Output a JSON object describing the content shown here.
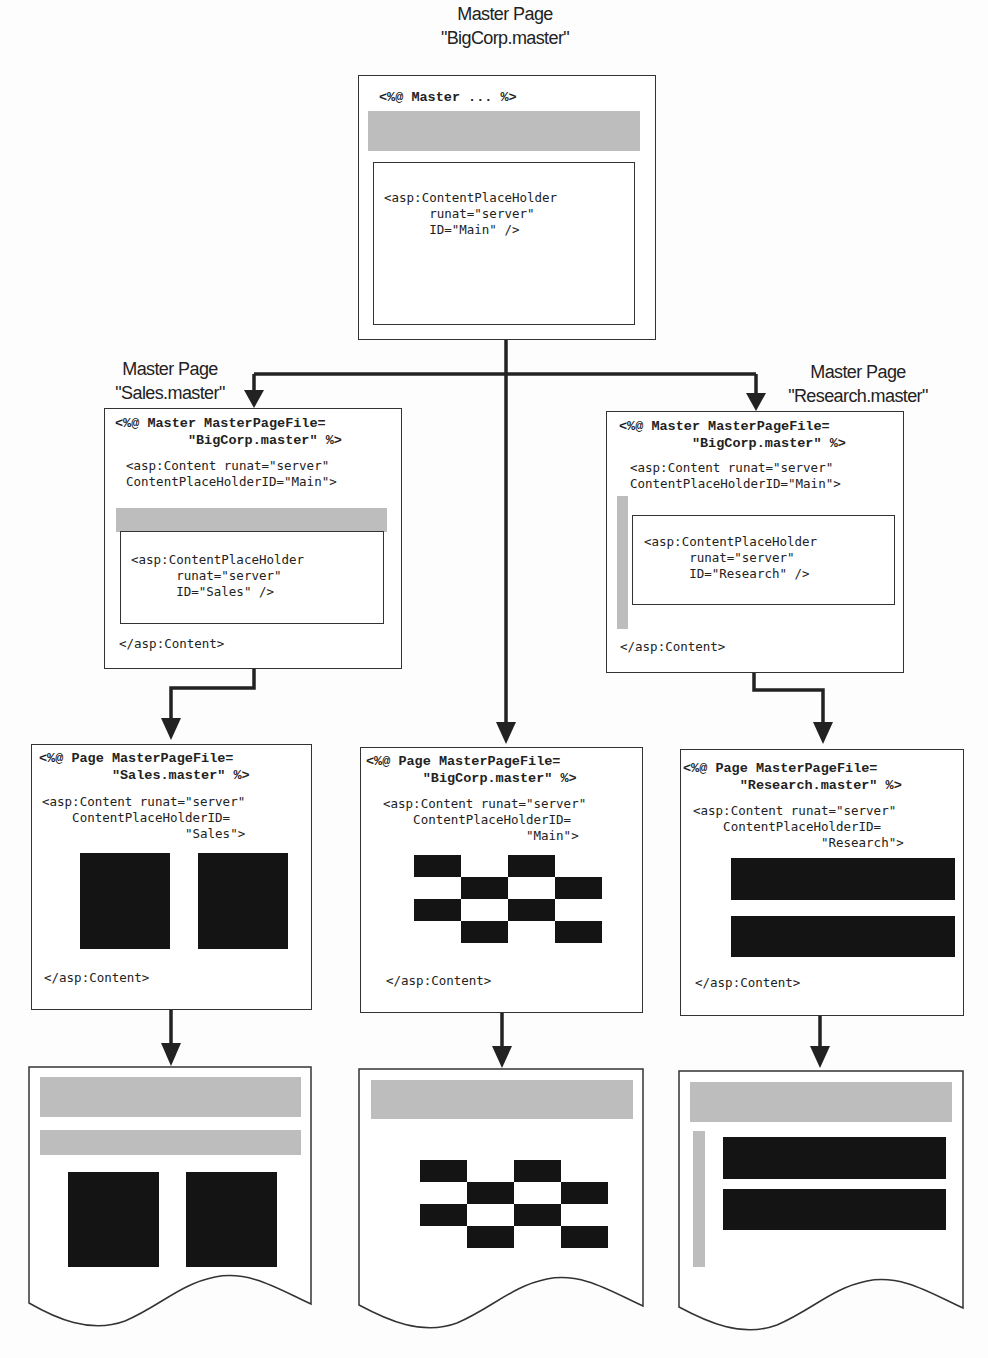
{
  "diagram": {
    "colors": {
      "line": "#222222",
      "master_region": "#bdbdbd",
      "content_block": "#141414",
      "background": "#fdfdfd"
    },
    "top_master": {
      "label_line1": "Master Page",
      "label_line2": "\"BigCorp.master\"",
      "directive": "<%@ Master ... %>",
      "placeholder_code": "<asp:ContentPlaceHolder\n      runat=\"server\"\n      ID=\"Main\" />"
    },
    "sales_master": {
      "label_line1": "Master Page",
      "label_line2": "\"Sales.master\"",
      "directive": "<%@ Master MasterPageFile=\n         \"BigCorp.master\" %>",
      "content_open": "<asp:Content runat=\"server\"\nContentPlaceHolderID=\"Main\">",
      "placeholder_code": "<asp:ContentPlaceHolder\n      runat=\"server\"\n      ID=\"Sales\" />",
      "content_close": "</asp:Content>"
    },
    "research_master": {
      "label_line1": "Master Page",
      "label_line2": "\"Research.master\"",
      "directive": "<%@ Master MasterPageFile=\n         \"BigCorp.master\" %>",
      "content_open": "<asp:Content runat=\"server\"\nContentPlaceHolderID=\"Main\">",
      "placeholder_code": "<asp:ContentPlaceHolder\n      runat=\"server\"\n      ID=\"Research\" />",
      "content_close": "</asp:Content>"
    },
    "sales_page": {
      "directive": "<%@ Page MasterPageFile=\n         \"Sales.master\" %>",
      "content_open": "<asp:Content runat=\"server\"\n    ContentPlaceHolderID=\n                   \"Sales\">",
      "content_close": "</asp:Content>"
    },
    "main_page": {
      "directive": "<%@ Page MasterPageFile=\n       \"BigCorp.master\" %>",
      "content_open": "<asp:Content runat=\"server\"\n    ContentPlaceHolderID=\n                   \"Main\">",
      "content_close": "</asp:Content>"
    },
    "research_page": {
      "directive": "<%@ Page MasterPageFile=\n       \"Research.master\" %>",
      "content_open": "<asp:Content runat=\"server\"\n    ContentPlaceHolderID=\n                 \"Research\">",
      "content_close": "</asp:Content>"
    },
    "rendered_outputs": [
      {
        "name": "sales-rendered-page"
      },
      {
        "name": "main-rendered-page"
      },
      {
        "name": "research-rendered-page"
      }
    ]
  }
}
